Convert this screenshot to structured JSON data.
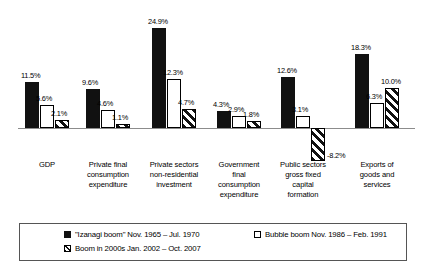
{
  "chart_data": {
    "type": "bar",
    "title": "",
    "subtitle": "",
    "xlabel": "",
    "ylabel": "",
    "grid": false,
    "legend_position": "bottom",
    "ylim": [
      -10,
      27
    ],
    "categories": [
      "GDP",
      "Private final\nconsumption\nexpenditure",
      "Private sectors\nnon-residential\ninvestment",
      "Government\nfinal\nconsumption\nexpenditure",
      "Public sectors\ngross fixed\ncapital\nformation",
      "Exports of\ngoods and\nservices"
    ],
    "series": [
      {
        "name": "\"Izanagi boom\" Nov. 1965 – Jul. 1970",
        "style": "solid",
        "values": [
          11.5,
          9.6,
          24.9,
          4.3,
          12.6,
          18.3
        ],
        "labels": [
          "11.5%",
          "9.6%",
          "24.9%",
          "4.3%",
          "12.6%",
          "18.3%"
        ]
      },
      {
        "name": "Bubble boom Nov. 1986 – Feb. 1991",
        "style": "open",
        "values": [
          5.6,
          4.6,
          12.3,
          2.9,
          3.1,
          6.3
        ],
        "labels": [
          "5.6%",
          "4.6%",
          "12.3%",
          "2.9%",
          "3.1%",
          "6.3%"
        ]
      },
      {
        "name": "Boom in 2000s  Jan. 2002 – Oct. 2007",
        "style": "hatch",
        "values": [
          2.1,
          1.1,
          4.7,
          1.8,
          -8.2,
          10.0
        ],
        "labels": [
          "2.1%",
          "1.1%",
          "4.7%",
          "1.8%",
          "-8.2%",
          "10.0%"
        ]
      }
    ]
  },
  "legend": {
    "items": [
      {
        "swatch": "solid",
        "label": "\"Izanagi boom\" Nov. 1965 – Jul. 1970"
      },
      {
        "swatch": "hatch",
        "label": "Boom in 2000s  Jan. 2002 – Oct. 2007"
      },
      {
        "swatch": "open",
        "label": "Bubble boom Nov. 1986 – Feb. 1991"
      }
    ]
  },
  "colors": {
    "series_solid": "#111111",
    "series_open": "#ffffff",
    "series_hatch": "#111111",
    "axis": "#8c8c8c",
    "border": "#555555",
    "background": "#ffffff"
  }
}
